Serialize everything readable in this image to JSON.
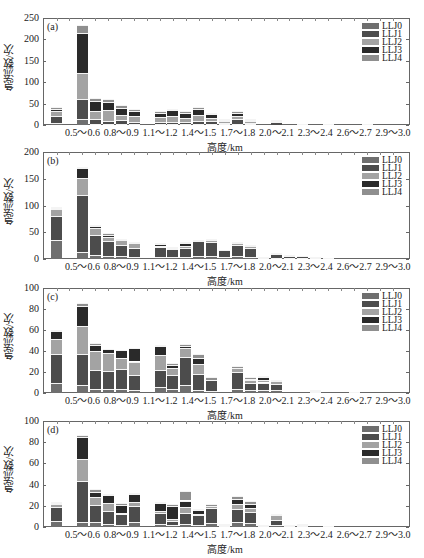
{
  "chart_data": [
    {
      "type": "bar",
      "stacked": true,
      "panel_label": "(a)",
      "title": "",
      "xlabel": "高度/km",
      "ylabel": "急流数/次",
      "ylim": [
        0,
        250
      ],
      "yticks": [
        0,
        50,
        100,
        150,
        200,
        250
      ],
      "xtick_labels": [
        "0.5～0.6",
        "0.8～0.9",
        "1.1～1.2",
        "1.4～1.5",
        "1.7～1.8",
        "2.0～2.1",
        "2.3～2.4",
        "2.6～2.7",
        "2.9～3.0"
      ],
      "categories": [
        "0.3～0.4",
        "0.4～0.5",
        "0.5～0.6",
        "0.6～0.7",
        "0.7～0.8",
        "0.8～0.9",
        "0.9～1.0",
        "1.0～1.1",
        "1.1～1.2",
        "1.2～1.3",
        "1.3～1.4",
        "1.4～1.5",
        "1.5～1.6",
        "1.6～1.7",
        "1.7～1.8",
        "1.8～1.9",
        "1.9～2.0",
        "2.0～2.1",
        "2.1～2.2",
        "2.2～2.3",
        "2.3～2.4",
        "2.4～2.5",
        "2.5～2.6",
        "2.6～2.7",
        "2.7～2.8",
        "2.8～2.9",
        "2.9～3.0"
      ],
      "legend_position": "upper right",
      "grid": false,
      "series": [
        {
          "name": "LLJ0",
          "values": [
            5,
            0,
            15,
            3,
            2,
            3,
            2,
            0,
            2,
            2,
            2,
            3,
            3,
            2,
            3,
            2,
            0,
            1,
            0,
            0,
            0,
            0,
            0,
            0,
            0,
            0,
            0
          ]
        },
        {
          "name": "LLJ1",
          "values": [
            15,
            0,
            45,
            12,
            8,
            8,
            6,
            0,
            5,
            6,
            5,
            6,
            6,
            3,
            10,
            3,
            0,
            7,
            0,
            1,
            0,
            0,
            0,
            0,
            0,
            0,
            0
          ]
        },
        {
          "name": "LLJ2",
          "values": [
            12,
            0,
            62,
            18,
            26,
            12,
            12,
            0,
            12,
            12,
            10,
            14,
            8,
            4,
            7,
            4,
            0,
            1,
            0,
            0,
            0,
            0,
            0,
            0,
            0,
            0,
            0
          ]
        },
        {
          "name": "LLJ3",
          "values": [
            6,
            0,
            92,
            22,
            18,
            16,
            12,
            0,
            10,
            14,
            10,
            14,
            8,
            2,
            8,
            2,
            0,
            1,
            0,
            1,
            0,
            1,
            0,
            0,
            1,
            0,
            0
          ]
        },
        {
          "name": "LLJ4",
          "values": [
            4,
            0,
            19,
            7,
            7,
            7,
            6,
            0,
            4,
            4,
            6,
            4,
            4,
            3,
            4,
            2,
            0,
            0,
            0,
            0,
            0,
            0,
            0,
            0,
            0,
            0,
            0
          ]
        }
      ],
      "totals_approx": [
        42,
        0,
        233,
        62,
        61,
        46,
        38,
        0,
        33,
        38,
        33,
        41,
        29,
        14,
        32,
        13,
        0,
        10,
        0,
        2,
        0,
        1,
        0,
        0,
        1,
        0,
        0
      ]
    },
    {
      "type": "bar",
      "stacked": true,
      "panel_label": "(b)",
      "xlabel": "高度/km",
      "ylabel": "急流数/次",
      "ylim": [
        0,
        200
      ],
      "yticks": [
        0,
        50,
        100,
        150,
        200
      ],
      "xtick_labels": [
        "0.5～0.6",
        "0.8～0.9",
        "1.1～1.2",
        "1.4～1.5",
        "1.7～1.8",
        "2.0～2.1",
        "2.3～2.4",
        "2.6～2.7",
        "2.9～3.0"
      ],
      "categories": [
        "0.3～0.4",
        "0.4～0.5",
        "0.5～0.6",
        "0.6～0.7",
        "0.7～0.8",
        "0.8～0.9",
        "0.9～1.0",
        "1.0～1.1",
        "1.1～1.2",
        "1.2～1.3",
        "1.3～1.4",
        "1.4～1.5",
        "1.5～1.6",
        "1.6～1.7",
        "1.7～1.8",
        "1.8～1.9",
        "1.9～2.0",
        "2.0～2.1",
        "2.1～2.2",
        "2.2～2.3",
        "2.3～2.4",
        "2.4～2.5",
        "2.5～2.6",
        "2.6～2.7",
        "2.7～2.8",
        "2.8～2.9",
        "2.9～3.0"
      ],
      "legend_position": "upper right",
      "grid": false,
      "series": [
        {
          "name": "LLJ0",
          "values": [
            35,
            0,
            14,
            8,
            6,
            5,
            4,
            0,
            4,
            3,
            4,
            5,
            5,
            3,
            5,
            4,
            1,
            2,
            1,
            1,
            0,
            0,
            0,
            0,
            0,
            0,
            0
          ]
        },
        {
          "name": "LLJ1",
          "values": [
            46,
            0,
            106,
            37,
            27,
            21,
            17,
            0,
            18,
            15,
            16,
            28,
            26,
            14,
            21,
            17,
            3,
            7,
            4,
            4,
            1,
            1,
            0,
            0,
            0,
            0,
            0
          ]
        },
        {
          "name": "LLJ2",
          "values": [
            12,
            0,
            32,
            13,
            8,
            10,
            8,
            0,
            2,
            1,
            5,
            0,
            4,
            0,
            3,
            4,
            0,
            0,
            0,
            0,
            0,
            0,
            0,
            0,
            0,
            0,
            0
          ]
        },
        {
          "name": "LLJ3",
          "values": [
            3,
            0,
            18,
            3,
            4,
            0,
            1,
            0,
            4,
            1,
            4,
            0,
            0,
            0,
            1,
            0,
            0,
            0,
            0,
            0,
            0,
            0,
            0,
            0,
            0,
            0,
            0
          ]
        },
        {
          "name": "LLJ4",
          "values": [
            1,
            0,
            2,
            2,
            3,
            1,
            1,
            0,
            2,
            1,
            1,
            1,
            1,
            0,
            1,
            2,
            0,
            1,
            1,
            0,
            1,
            0,
            0,
            0,
            0,
            0,
            0
          ]
        }
      ],
      "totals_approx": [
        97,
        0,
        172,
        63,
        48,
        37,
        31,
        0,
        30,
        21,
        30,
        34,
        36,
        17,
        31,
        27,
        4,
        10,
        6,
        5,
        2,
        1,
        0,
        0,
        0,
        0,
        0
      ]
    },
    {
      "type": "bar",
      "stacked": true,
      "panel_label": "(c)",
      "xlabel": "高度/km",
      "ylabel": "急流数/次",
      "ylim": [
        0,
        100
      ],
      "yticks": [
        0,
        20,
        40,
        60,
        80,
        100
      ],
      "xtick_labels": [
        "0.5～0.6",
        "0.8～0.9",
        "1.1～1.2",
        "1.4～1.5",
        "1.7～1.8",
        "2.0～2.1",
        "2.3～2.4",
        "2.6～2.7",
        "2.9～3.0"
      ],
      "categories": [
        "0.3～0.4",
        "0.4～0.5",
        "0.5～0.6",
        "0.6～0.7",
        "0.7～0.8",
        "0.8～0.9",
        "0.9～1.0",
        "1.0～1.1",
        "1.1～1.2",
        "1.2～1.3",
        "1.3～1.4",
        "1.4～1.5",
        "1.5～1.6",
        "1.6～1.7",
        "1.7～1.8",
        "1.8～1.9",
        "1.9～2.0",
        "2.0～2.1",
        "2.1～2.2",
        "2.2～2.3",
        "2.3～2.4",
        "2.4～2.5",
        "2.5～2.6",
        "2.6～2.7",
        "2.7～2.8",
        "2.8～2.9",
        "2.9～3.0"
      ],
      "legend_position": "upper right",
      "grid": false,
      "series": [
        {
          "name": "LLJ0",
          "values": [
            10,
            0,
            8,
            4,
            4,
            4,
            3,
            0,
            6,
            4,
            8,
            3,
            2,
            0,
            4,
            3,
            3,
            3,
            0,
            0,
            1,
            0,
            0,
            0,
            0,
            0,
            0
          ]
        },
        {
          "name": "LLJ1",
          "values": [
            27,
            0,
            29,
            18,
            17,
            19,
            14,
            0,
            16,
            13,
            26,
            15,
            10,
            0,
            16,
            7,
            7,
            6,
            0,
            0,
            1,
            0,
            0,
            1,
            0,
            0,
            0
          ]
        },
        {
          "name": "LLJ2",
          "values": [
            14,
            0,
            27,
            18,
            17,
            10,
            13,
            0,
            14,
            7,
            9,
            10,
            0,
            0,
            4,
            2,
            2,
            2,
            0,
            0,
            0,
            0,
            0,
            0,
            0,
            0,
            0
          ]
        },
        {
          "name": "LLJ3",
          "values": [
            8,
            0,
            19,
            6,
            4,
            8,
            13,
            0,
            9,
            3,
            2,
            5,
            0,
            0,
            0,
            1,
            3,
            0,
            0,
            0,
            1,
            0,
            0,
            0,
            0,
            0,
            0
          ]
        },
        {
          "name": "LLJ4",
          "values": [
            1,
            0,
            3,
            2,
            0,
            0,
            0,
            0,
            1,
            2,
            2,
            4,
            3,
            0,
            2,
            2,
            1,
            1,
            0,
            0,
            0,
            0,
            0,
            0,
            0,
            0,
            0
          ]
        }
      ],
      "totals_approx": [
        60,
        0,
        86,
        48,
        42,
        41,
        43,
        0,
        46,
        29,
        47,
        37,
        15,
        0,
        26,
        15,
        16,
        12,
        0,
        0,
        3,
        0,
        0,
        1,
        0,
        0,
        0
      ]
    },
    {
      "type": "bar",
      "stacked": true,
      "panel_label": "(d)",
      "xlabel": "高度/km",
      "ylabel": "急流数/次",
      "ylim": [
        0,
        100
      ],
      "yticks": [
        0,
        20,
        40,
        60,
        80,
        100
      ],
      "xtick_labels": [
        "0.5～0.6",
        "0.8～0.9",
        "1.1～1.2",
        "1.4～1.5",
        "1.7～1.8",
        "2.0～2.1",
        "2.3～2.4",
        "2.6～2.7",
        "2.9～3.0"
      ],
      "categories": [
        "0.3～0.4",
        "0.4～0.5",
        "0.5～0.6",
        "0.6～0.7",
        "0.7～0.8",
        "0.8～0.9",
        "0.9～1.0",
        "1.0～1.1",
        "1.1～1.2",
        "1.2～1.3",
        "1.3～1.4",
        "1.4～1.5",
        "1.5～1.6",
        "1.6～1.7",
        "1.7～1.8",
        "1.8～1.9",
        "1.9～2.0",
        "2.0～2.1",
        "2.1～2.2",
        "2.2～2.3",
        "2.3～2.4",
        "2.4～2.5",
        "2.5～2.6",
        "2.6～2.7",
        "2.7～2.8",
        "2.8～2.9",
        "2.9～3.0"
      ],
      "legend_position": "upper right",
      "grid": false,
      "series": [
        {
          "name": "LLJ0",
          "values": [
            6,
            0,
            5,
            5,
            3,
            2,
            5,
            0,
            3,
            2,
            3,
            2,
            4,
            1,
            5,
            4,
            1,
            2,
            1,
            1,
            0,
            1,
            0,
            0,
            0,
            0,
            0
          ]
        },
        {
          "name": "LLJ1",
          "values": [
            13,
            0,
            38,
            16,
            12,
            10,
            15,
            0,
            10,
            4,
            10,
            9,
            14,
            1,
            12,
            10,
            1,
            5,
            1,
            1,
            0,
            0,
            0,
            0,
            0,
            0,
            0
          ]
        },
        {
          "name": "LLJ2",
          "values": [
            3,
            0,
            21,
            7,
            8,
            1,
            4,
            0,
            2,
            2,
            6,
            1,
            2,
            0,
            5,
            4,
            0,
            4,
            0,
            0,
            0,
            0,
            0,
            0,
            0,
            0,
            0
          ]
        },
        {
          "name": "LLJ3",
          "values": [
            1,
            0,
            21,
            5,
            7,
            8,
            7,
            0,
            8,
            12,
            6,
            4,
            0,
            1,
            4,
            4,
            0,
            0,
            0,
            1,
            0,
            0,
            0,
            0,
            0,
            0,
            0
          ]
        },
        {
          "name": "LLJ4",
          "values": [
            1,
            0,
            2,
            3,
            1,
            2,
            1,
            0,
            1,
            2,
            9,
            1,
            2,
            0,
            3,
            3,
            0,
            1,
            0,
            0,
            0,
            0,
            0,
            0,
            0,
            0,
            0
          ]
        }
      ],
      "totals_approx": [
        24,
        0,
        87,
        36,
        31,
        23,
        32,
        0,
        24,
        22,
        34,
        17,
        22,
        3,
        29,
        25,
        2,
        12,
        2,
        3,
        0,
        1,
        0,
        0,
        0,
        0,
        0
      ]
    }
  ],
  "legend": {
    "items": [
      {
        "label": "LLJ0",
        "color": "#6f6f6f"
      },
      {
        "label": "LLJ1",
        "color": "#4c4c4c"
      },
      {
        "label": "LLJ2",
        "color": "#a3a3a3"
      },
      {
        "label": "LLJ3",
        "color": "#2a2a2a"
      },
      {
        "label": "LLJ4",
        "color": "#8f8f8f"
      }
    ]
  }
}
